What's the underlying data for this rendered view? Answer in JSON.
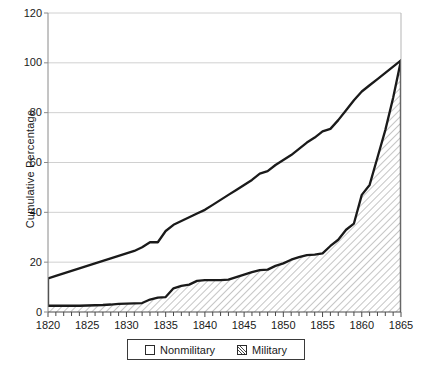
{
  "chart_data": {
    "type": "area",
    "title": "",
    "subtitle": "",
    "xlabel": "",
    "ylabel": "Cumulative Percentage",
    "xlim": [
      1820,
      1865
    ],
    "ylim": [
      0,
      120
    ],
    "ytick_labels": [
      "0",
      "20",
      "40",
      "60",
      "80",
      "100",
      "120"
    ],
    "ytick_values": [
      0,
      20,
      40,
      60,
      80,
      100,
      120
    ],
    "xtick_labels": [
      "1820",
      "1825",
      "1830",
      "1835",
      "1840",
      "1845",
      "1850",
      "1855",
      "1860",
      "1865"
    ],
    "xtick_values": [
      1820,
      1825,
      1830,
      1835,
      1840,
      1845,
      1850,
      1855,
      1860,
      1865
    ],
    "minor_xtick_step": 1,
    "grid": "horizontal",
    "legend_position": "bottom-center",
    "stacked": false,
    "x": [
      1820,
      1821,
      1822,
      1823,
      1824,
      1825,
      1826,
      1827,
      1828,
      1829,
      1830,
      1831,
      1832,
      1833,
      1834,
      1835,
      1836,
      1837,
      1838,
      1839,
      1840,
      1841,
      1842,
      1843,
      1844,
      1845,
      1846,
      1847,
      1848,
      1849,
      1850,
      1851,
      1852,
      1853,
      1854,
      1855,
      1856,
      1857,
      1858,
      1859,
      1860,
      1861,
      1862,
      1863,
      1864,
      1865
    ],
    "series": [
      {
        "name": "Nonmilitary",
        "fill": "none",
        "line_color": "#1a1a1a",
        "values": [
          13.5,
          14.5,
          15.5,
          16.5,
          17.5,
          18.5,
          19.5,
          20.5,
          21.5,
          22.5,
          23.5,
          24.5,
          26.0,
          28.0,
          28.0,
          32.5,
          35.0,
          36.5,
          38.0,
          39.5,
          41.0,
          43.0,
          45.0,
          47.0,
          49.0,
          51.0,
          53.0,
          55.5,
          56.5,
          59.0,
          61.0,
          63.0,
          65.5,
          68.0,
          70.0,
          72.5,
          73.5,
          77.0,
          81.0,
          85.0,
          88.5,
          91.0,
          93.5,
          96.0,
          98.5,
          101.0
        ]
      },
      {
        "name": "Military",
        "fill": "hatch-45",
        "line_color": "#1a1a1a",
        "values": [
          2.5,
          2.5,
          2.5,
          2.5,
          2.5,
          2.6,
          2.7,
          2.8,
          3.0,
          3.3,
          3.4,
          3.5,
          3.6,
          5.0,
          5.8,
          6.0,
          9.5,
          10.5,
          11.0,
          12.5,
          12.8,
          12.8,
          12.8,
          13.0,
          14.0,
          15.0,
          16.0,
          16.8,
          17.0,
          18.5,
          19.5,
          21.0,
          22.0,
          22.8,
          23.0,
          23.5,
          26.5,
          29.0,
          33.0,
          35.5,
          47.0,
          51.0,
          62.0,
          73.0,
          86.0,
          101.0
        ]
      }
    ],
    "legend": [
      {
        "label": "Nonmilitary",
        "swatch": "plain-box"
      },
      {
        "label": "Military",
        "swatch": "hatched-box"
      }
    ],
    "colors": {
      "line": "#1a1a1a",
      "grid": "#d0d0d0",
      "axis": "#8a8a8a",
      "hatch": "#6a6a6a",
      "background": "#ffffff"
    }
  }
}
